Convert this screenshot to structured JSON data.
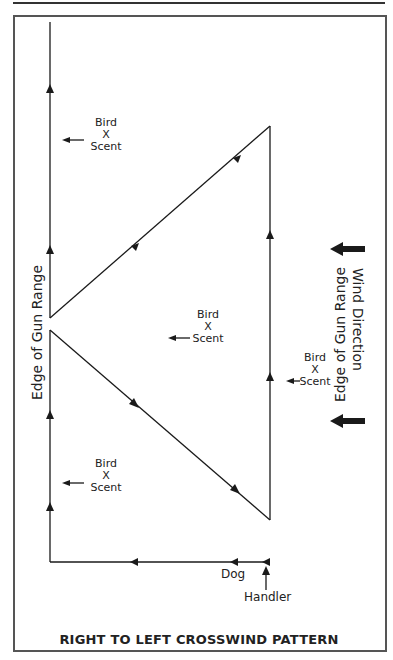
{
  "diagram": {
    "title": "RIGHT TO LEFT CROSSWIND PATTERN",
    "left_edge_label": "Edge of Gun Range",
    "right_edge_label": "Edge of Gun Range",
    "wind_label": "Wind Direction",
    "dog_label": "Dog",
    "handler_label": "Handler",
    "scent_markers": [
      {
        "bird": "Bird",
        "x": "X",
        "scent": "Scent"
      },
      {
        "bird": "Bird",
        "x": "X",
        "scent": "Scent"
      },
      {
        "bird": "Bird",
        "x": "X",
        "scent": "Scent"
      },
      {
        "bird": "Bird",
        "x": "X",
        "scent": "Scent"
      }
    ],
    "colors": {
      "line": "#1a1a1a",
      "frame": "#555555",
      "background": "#ffffff"
    }
  }
}
